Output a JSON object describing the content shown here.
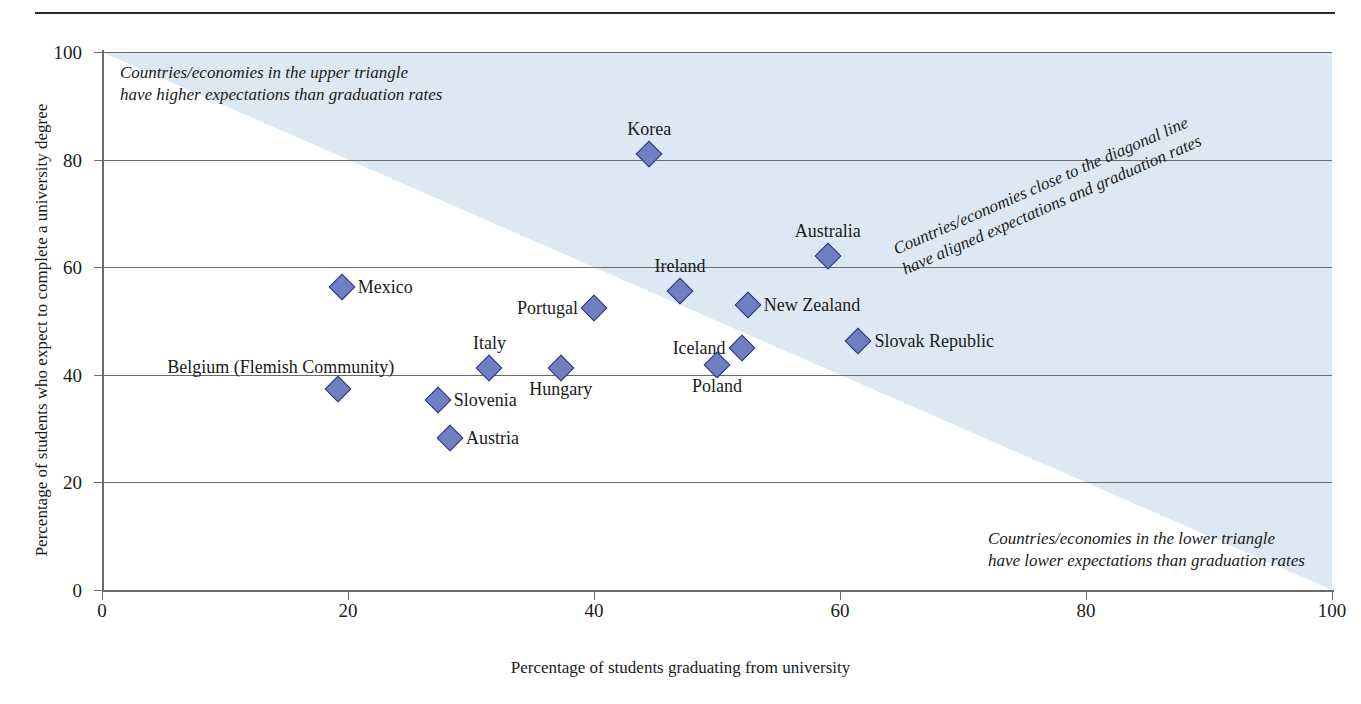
{
  "chart_data": {
    "type": "scatter",
    "title": "",
    "xlabel": "Percentage of students graduating from university",
    "ylabel": "Percentage of students who expect to complete a university degree",
    "xlim": [
      0,
      100
    ],
    "ylim": [
      0,
      100
    ],
    "xticks": [
      0,
      20,
      40,
      60,
      80,
      100
    ],
    "yticks": [
      0,
      20,
      40,
      60,
      80,
      100
    ],
    "grid": "horizontal",
    "legend": "none",
    "reference_line": {
      "type": "diagonal",
      "from": [
        0,
        0
      ],
      "to": [
        100,
        100
      ],
      "description": "y = x identity line; shaded band above it"
    },
    "points": [
      {
        "label": "Korea",
        "x": 44.5,
        "y": 81.0,
        "label_pos": "above"
      },
      {
        "label": "Australia",
        "x": 59.0,
        "y": 62.0,
        "label_pos": "above"
      },
      {
        "label": "Mexico",
        "x": 19.5,
        "y": 56.3,
        "label_pos": "right"
      },
      {
        "label": "Ireland",
        "x": 47.0,
        "y": 55.5,
        "label_pos": "above"
      },
      {
        "label": "New Zealand",
        "x": 52.5,
        "y": 53.0,
        "label_pos": "right"
      },
      {
        "label": "Portugal",
        "x": 40.0,
        "y": 52.5,
        "label_pos": "left"
      },
      {
        "label": "Slovak Republic",
        "x": 61.5,
        "y": 46.3,
        "label_pos": "right"
      },
      {
        "label": "Iceland",
        "x": 52.0,
        "y": 45.0,
        "label_pos": "left"
      },
      {
        "label": "Poland",
        "x": 50.0,
        "y": 41.8,
        "label_pos": "below"
      },
      {
        "label": "Italy",
        "x": 31.5,
        "y": 41.3,
        "label_pos": "above"
      },
      {
        "label": "Hungary",
        "x": 37.3,
        "y": 41.2,
        "label_pos": "below"
      },
      {
        "label": "Belgium (Flemish Community)",
        "x": 19.2,
        "y": 37.3,
        "label_pos": "above-left"
      },
      {
        "label": "Slovenia",
        "x": 27.3,
        "y": 35.3,
        "label_pos": "right"
      },
      {
        "label": "Austria",
        "x": 28.3,
        "y": 28.3,
        "label_pos": "right"
      }
    ],
    "annotations": [
      {
        "name": "upper-triangle-note",
        "text": "Countries/economies in the upper triangle\nhave higher expectations than graduation rates"
      },
      {
        "name": "diagonal-note",
        "text": "Countries/economies close to the diagonal line\nhave aligned expectations and graduation rates"
      },
      {
        "name": "lower-triangle-note",
        "text": "Countries/economies in the lower triangle\nhave lower expectations than graduation rates"
      }
    ],
    "colors": {
      "marker_fill": "#6f7fc2",
      "marker_stroke": "#2f3a72",
      "band_fill": "#dce9f5",
      "axis": "#6b6b6b",
      "text": "#1a1a1a"
    }
  }
}
